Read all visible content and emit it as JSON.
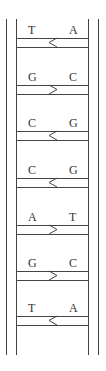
{
  "diagram": {
    "strand_color": "#444444",
    "pairs": [
      {
        "left": "T",
        "right": "A",
        "arrow": "left"
      },
      {
        "left": "G",
        "right": "C",
        "arrow": "right"
      },
      {
        "left": "C",
        "right": "G",
        "arrow": "left"
      },
      {
        "left": "C",
        "right": "G",
        "arrow": "left"
      },
      {
        "left": "A",
        "right": "T",
        "arrow": "right"
      },
      {
        "left": "G",
        "right": "C",
        "arrow": "right"
      },
      {
        "left": "T",
        "right": "A",
        "arrow": "left"
      }
    ]
  }
}
